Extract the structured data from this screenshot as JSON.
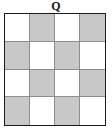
{
  "figure": {
    "label": "Q",
    "type": "checkerboard-grid",
    "rows": 4,
    "columns": 4,
    "colors": {
      "shaded_cell": "#c8c8c8",
      "light_cell": "#ffffff",
      "outer_border": "#1a1a1a",
      "inner_gridline": "#8d8d8d",
      "label_text": "#161616",
      "background": "#ffffff"
    },
    "pattern_note": "alternating checkerboard, top-left cell light",
    "cells": [
      [
        {
          "row": 1,
          "col": 1,
          "fill": "light"
        },
        {
          "row": 1,
          "col": 2,
          "fill": "shaded"
        },
        {
          "row": 1,
          "col": 3,
          "fill": "light"
        },
        {
          "row": 1,
          "col": 4,
          "fill": "shaded"
        }
      ],
      [
        {
          "row": 2,
          "col": 1,
          "fill": "shaded"
        },
        {
          "row": 2,
          "col": 2,
          "fill": "light"
        },
        {
          "row": 2,
          "col": 3,
          "fill": "shaded"
        },
        {
          "row": 2,
          "col": 4,
          "fill": "light"
        }
      ],
      [
        {
          "row": 3,
          "col": 1,
          "fill": "light"
        },
        {
          "row": 3,
          "col": 2,
          "fill": "shaded"
        },
        {
          "row": 3,
          "col": 3,
          "fill": "light"
        },
        {
          "row": 3,
          "col": 4,
          "fill": "shaded"
        }
      ],
      [
        {
          "row": 4,
          "col": 1,
          "fill": "shaded"
        },
        {
          "row": 4,
          "col": 2,
          "fill": "light"
        },
        {
          "row": 4,
          "col": 3,
          "fill": "shaded"
        },
        {
          "row": 4,
          "col": 4,
          "fill": "light"
        }
      ]
    ]
  }
}
